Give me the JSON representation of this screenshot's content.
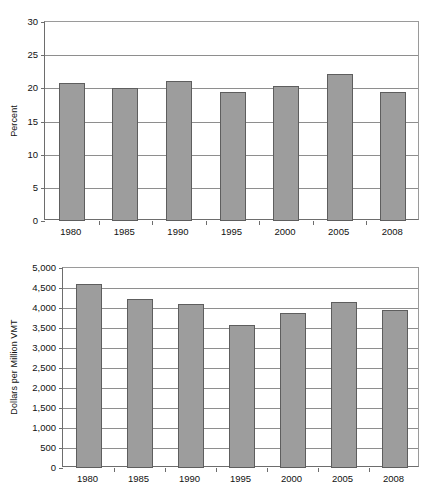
{
  "chart_data": [
    {
      "id": "percent-chart",
      "type": "bar",
      "title": "",
      "xlabel": "",
      "ylabel": "Percent",
      "categories": [
        "1980",
        "1985",
        "1990",
        "1995",
        "2000",
        "2005",
        "2008"
      ],
      "values": [
        20.8,
        20.1,
        21.1,
        19.5,
        20.4,
        22.1,
        19.4
      ],
      "ylim": [
        0,
        30
      ],
      "yticks": [
        0,
        5,
        10,
        15,
        20,
        25,
        30
      ],
      "ytick_labels": [
        "0",
        "5",
        "10",
        "15",
        "20",
        "25",
        "30"
      ],
      "grid": true,
      "legend": "none",
      "bar_color": "#9d9d9d",
      "bar_edge_color": "#5e5e5e"
    },
    {
      "id": "dollars-chart",
      "type": "bar",
      "title": "",
      "xlabel": "",
      "ylabel": "Dollars per Million VMT",
      "categories": [
        "1980",
        "1985",
        "1990",
        "1995",
        "2000",
        "2005",
        "2008"
      ],
      "values": [
        4610,
        4230,
        4110,
        3570,
        3880,
        4150,
        3960
      ],
      "ylim": [
        0,
        5000
      ],
      "yticks": [
        0,
        500,
        1000,
        1500,
        2000,
        2500,
        3000,
        3500,
        4000,
        4500,
        5000
      ],
      "ytick_labels": [
        "0",
        "500",
        "1,000",
        "1,500",
        "2,000",
        "2,500",
        "3,000",
        "3,500",
        "4,000",
        "4,500",
        "5,000"
      ],
      "grid": true,
      "legend": "none",
      "bar_color": "#9d9d9d",
      "bar_edge_color": "#5e5e5e"
    }
  ]
}
